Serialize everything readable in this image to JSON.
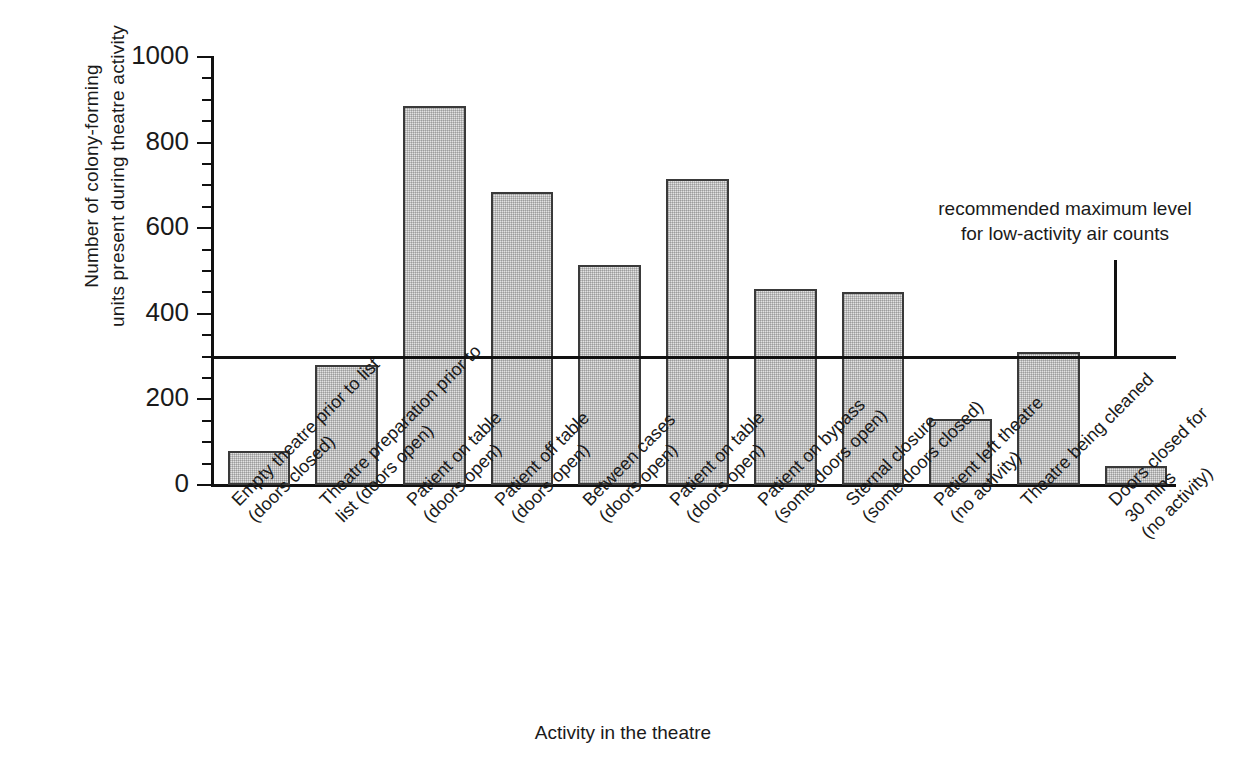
{
  "chart_data": {
    "type": "bar",
    "title": "",
    "xlabel": "Activity in the theatre",
    "ylabel": "Number of colony-forming\nunits present during theatre activity",
    "ylim": [
      0,
      1000
    ],
    "ytick_labels": [
      "0",
      "200",
      "400",
      "600",
      "800",
      "1000"
    ],
    "ytick_values": [
      0,
      200,
      400,
      600,
      800,
      1000
    ],
    "minor_tick_step": 50,
    "grid": false,
    "legend": "none",
    "categories": [
      "Empty theatre prior to list\n(doors closed)",
      "Theatre preparation prior to\nlist (doors open)",
      "Patient on table\n(doors open)",
      "Patient off table\n(doors open)",
      "Between cases\n(doors open)",
      "Patient on table\n(doors open)",
      "Patient on bypass\n(some doors open)",
      "Sternal closure\n(some doors closed)",
      "Patient left theatre\n(no activity)",
      "Theatre being cleaned",
      "Doors closed for 30 mins\n(no activity)"
    ],
    "values": [
      80,
      280,
      885,
      685,
      515,
      715,
      458,
      450,
      155,
      310,
      45
    ],
    "annotations": [
      {
        "text": "recommended maximum level\nfor low-activity air counts",
        "value": 300,
        "kind": "reference-line"
      }
    ],
    "bar_fill_color": "#e2e2e2",
    "bar_edge_color": "#3a3a3a",
    "axis_color": "#111111"
  }
}
